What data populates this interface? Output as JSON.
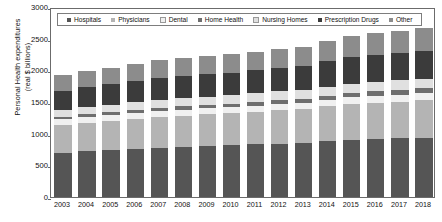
{
  "chart_data": {
    "type": "bar",
    "subtype": "stacked-bar",
    "title": "",
    "xlabel": "",
    "ylabel": "Personal Health expenditures\n(real $ billions)",
    "ylim": [
      0,
      3000
    ],
    "ytick_step": 500,
    "yticks": [
      "0",
      "500",
      "1000",
      "1500",
      "2000",
      "2500",
      "3000"
    ],
    "grid": false,
    "legend_position": "top-inside",
    "categories": [
      "2003",
      "2004",
      "2005",
      "2006",
      "2007",
      "2008",
      "2009",
      "2010",
      "2011",
      "2012",
      "2013",
      "2014",
      "2015",
      "2016",
      "2017",
      "2018"
    ],
    "series": [
      {
        "name": "Hospitals",
        "color": "#555555",
        "values": [
          700,
          720,
          740,
          755,
          775,
          790,
          805,
          815,
          830,
          845,
          855,
          880,
          900,
          915,
          925,
          935
        ]
      },
      {
        "name": "Physicians",
        "color": "#b4b4b4",
        "values": [
          440,
          455,
          465,
          480,
          490,
          495,
          500,
          505,
          515,
          525,
          530,
          550,
          565,
          575,
          580,
          590
        ]
      },
      {
        "name": "Dental",
        "color": "#f0f0f0",
        "values": [
          85,
          88,
          90,
          92,
          95,
          96,
          95,
          96,
          98,
          100,
          102,
          105,
          108,
          110,
          112,
          114
        ]
      },
      {
        "name": "Home Health",
        "color": "#6e6e6e",
        "values": [
          45,
          47,
          48,
          50,
          53,
          56,
          58,
          60,
          61,
          62,
          64,
          67,
          70,
          72,
          74,
          76
        ]
      },
      {
        "name": "Nursing Homes",
        "color": "#e0e0e0",
        "values": [
          110,
          113,
          116,
          118,
          122,
          125,
          128,
          130,
          132,
          135,
          138,
          142,
          146,
          149,
          152,
          155
        ]
      },
      {
        "name": "Prescription Drugs",
        "color": "#3b3b3b",
        "values": [
          300,
          315,
          325,
          340,
          350,
          352,
          355,
          358,
          362,
          365,
          378,
          400,
          415,
          425,
          432,
          440
        ]
      },
      {
        "name": "Other",
        "color": "#8c8c8c",
        "values": [
          245,
          252,
          258,
          265,
          272,
          278,
          282,
          288,
          294,
          300,
          308,
          320,
          332,
          342,
          350,
          358
        ]
      }
    ],
    "totals": [
      1925,
      1990,
      2042,
      2100,
      2157,
      2192,
      2223,
      2252,
      2292,
      2332,
      2375,
      2464,
      2536,
      2588,
      2625,
      2668
    ]
  },
  "legend": {
    "items": [
      {
        "label": "Hospitals"
      },
      {
        "label": "Physicians"
      },
      {
        "label": "Dental"
      },
      {
        "label": "Home Health"
      },
      {
        "label": "Nursing Homes"
      },
      {
        "label": "Prescription Drugs"
      },
      {
        "label": "Other"
      }
    ]
  },
  "axes": {
    "y_title": "Personal Health expenditures\n(real $ billions)"
  }
}
